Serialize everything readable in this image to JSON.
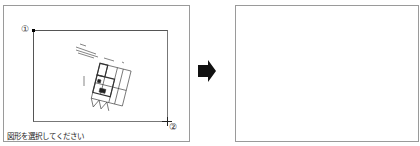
{
  "left_panel": {
    "status_text": "図形を選択してください",
    "markers": {
      "first": "①",
      "second": "②"
    },
    "drawing": "floor-plan-thumbnail"
  },
  "arrow": {
    "direction": "right",
    "color": "#111111"
  },
  "right_panel": {
    "content": ""
  },
  "colors": {
    "border": "#9a9a9a",
    "selection": "#555555",
    "background": "#ffffff"
  }
}
